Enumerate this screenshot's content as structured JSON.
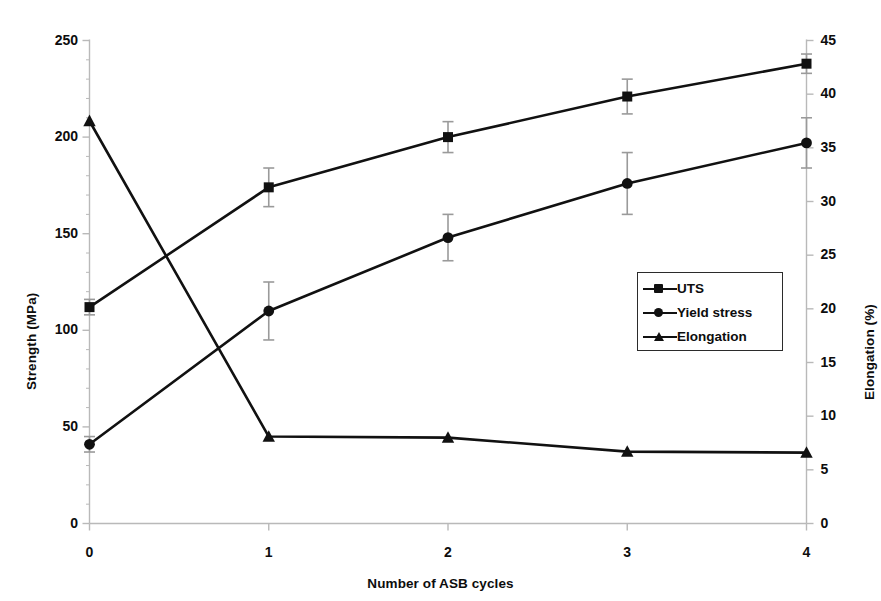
{
  "chart_data": {
    "type": "line",
    "title": "",
    "xlabel": "Number of ASB cycles",
    "ylabel": "Strength (MPa)",
    "ylabel_right": "Elongation (%)",
    "x": [
      0,
      1,
      2,
      3,
      4
    ],
    "xtick_labels": [
      "0",
      "1",
      "2",
      "3",
      "4"
    ],
    "xlim": [
      0,
      4
    ],
    "ylim": [
      0,
      250
    ],
    "ytick_labels": [
      "0",
      "50",
      "100",
      "150",
      "200",
      "250"
    ],
    "ytick_values": [
      0,
      50,
      100,
      150,
      200,
      250
    ],
    "ylim_right": [
      0,
      45
    ],
    "ytick_labels_right": [
      "0",
      "5",
      "10",
      "15",
      "20",
      "25",
      "30",
      "35",
      "40",
      "45"
    ],
    "ytick_values_right": [
      0,
      5,
      10,
      15,
      20,
      25,
      30,
      35,
      40,
      45
    ],
    "grid": false,
    "legend_position": "center-right",
    "series": [
      {
        "name": "UTS",
        "axis": "left",
        "marker": "square",
        "values": [
          112,
          174,
          200,
          221,
          238
        ],
        "errors": [
          4,
          10,
          8,
          9,
          5
        ]
      },
      {
        "name": "Yield stress",
        "axis": "left",
        "marker": "circle",
        "values": [
          41,
          110,
          148,
          176,
          197
        ],
        "errors": [
          4,
          15,
          12,
          16,
          13
        ]
      },
      {
        "name": "Elongation",
        "axis": "right",
        "marker": "triangle",
        "values": [
          37.5,
          8.1,
          8.0,
          6.7,
          6.6
        ],
        "errors": [
          0,
          0,
          0,
          0,
          0
        ]
      }
    ]
  },
  "legend": {
    "entries": [
      {
        "label": "UTS",
        "marker": "square"
      },
      {
        "label": "Yield stress",
        "marker": "circle"
      },
      {
        "label": "Elongation",
        "marker": "triangle"
      }
    ]
  },
  "colors": {
    "line": "#111111",
    "marker": "#111111",
    "axis": "#b9b9b9",
    "error_bar": "#9a9a9a",
    "text": "#0d0d0d",
    "background": "#ffffff"
  }
}
